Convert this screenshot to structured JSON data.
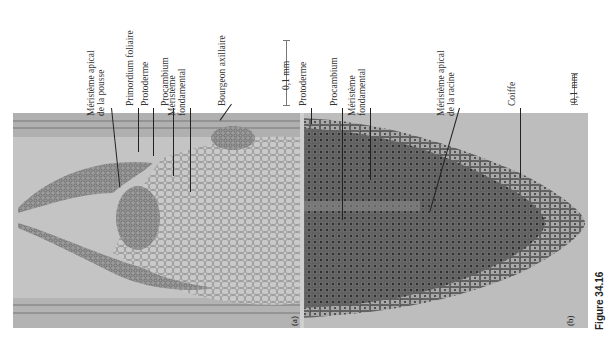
{
  "figure": {
    "caption": "Figure 34.16",
    "panels": [
      {
        "id": "a",
        "label": "(a)",
        "subject": "shoot apex micrograph",
        "scale": "0,1 mm",
        "labels": [
          "Méristème apical de la pousse",
          "Primordium foliaire",
          "Protoderme",
          "Procambium",
          "Méristème fondamental",
          "Bourgeon axillaire"
        ]
      },
      {
        "id": "b",
        "label": "(b)",
        "subject": "root tip micrograph",
        "scale": "0,1 mm",
        "labels": [
          "Protoderme",
          "Procambium",
          "Méristème fondamental",
          "Méristème apical de la racine",
          "Coiffe"
        ]
      }
    ]
  },
  "labels_a": {
    "l1a": "Méristème apical",
    "l1b": "de la pousse",
    "l2": "Primordium foliaire",
    "l3": "Protoderme",
    "l4": "Procambium",
    "l5a": "Méristème",
    "l5b": "fondamental",
    "l6": "Bourgeon axillaire",
    "scale": "0,1 mm",
    "panel": "(a)"
  },
  "labels_b": {
    "l1": "Protoderme",
    "l2": "Procambium",
    "l3a": "Méristème",
    "l3b": "fondamental",
    "l4a": "Méristème apical",
    "l4b": "de la racine",
    "l5": "Coiffe",
    "scale": "0,1 mm",
    "panel": "(b)"
  }
}
